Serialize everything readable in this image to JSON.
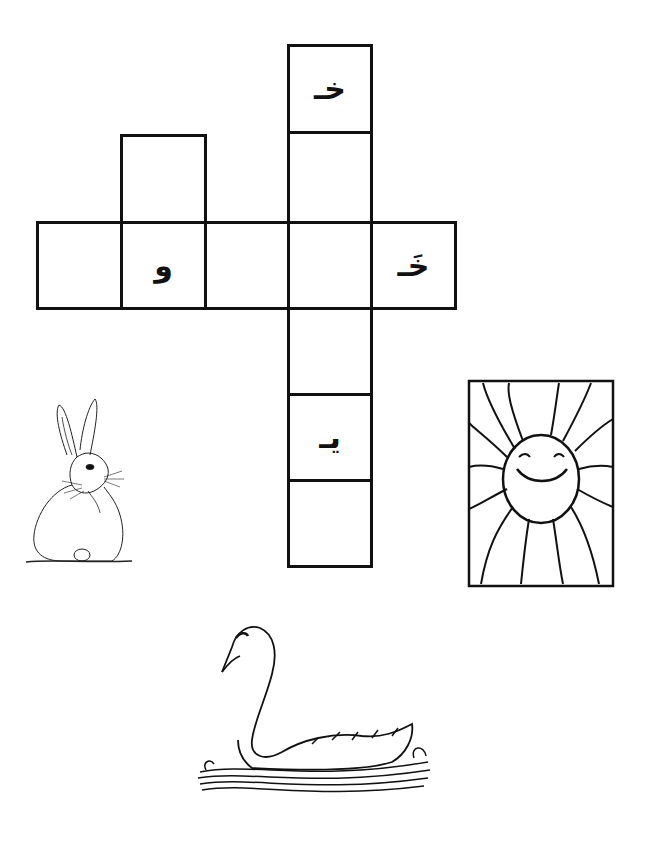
{
  "worksheet": {
    "type": "arabic-crossword",
    "grid": {
      "vertical_word": {
        "cells": [
          {
            "letter": "خـ"
          },
          {
            "letter": ""
          },
          {
            "letter": ""
          },
          {
            "letter": ""
          },
          {
            "letter": "يـ"
          },
          {
            "letter": ""
          }
        ]
      },
      "horizontal_word": {
        "cells_left_to_right": [
          {
            "letter": ""
          },
          {
            "letter": "و"
          },
          {
            "letter": ""
          },
          {
            "letter": ""
          },
          {
            "letter": "خَـ"
          }
        ]
      },
      "short_word_extra_cell": {
        "letter": ""
      }
    },
    "pictures": [
      {
        "name": "rabbit",
        "label": "rabbit drawing"
      },
      {
        "name": "sun",
        "label": "smiling sun drawing"
      },
      {
        "name": "swan",
        "label": "swan drawing"
      }
    ]
  }
}
